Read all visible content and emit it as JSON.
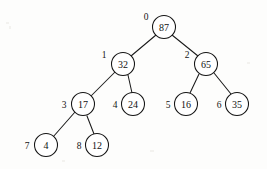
{
  "figure": {
    "kind": "binary-tree-diagram",
    "background_color": "#fdfdfc",
    "stroke_color": "#141414",
    "node_fill_color": "#ffffff",
    "node_radius": 11.5,
    "width": 267,
    "height": 169
  },
  "nodes": [
    {
      "index": "0",
      "value": "87",
      "cx": 164,
      "cy": 27,
      "index_x": 146,
      "index_y": 17
    },
    {
      "index": "1",
      "value": "32",
      "cx": 123,
      "cy": 64,
      "index_x": 104,
      "index_y": 55
    },
    {
      "index": "2",
      "value": "65",
      "cx": 206,
      "cy": 64,
      "index_x": 187,
      "index_y": 55
    },
    {
      "index": "3",
      "value": "17",
      "cx": 83,
      "cy": 104,
      "index_x": 64,
      "index_y": 105
    },
    {
      "index": "4",
      "value": "24",
      "cx": 133,
      "cy": 104,
      "index_x": 115,
      "index_y": 105
    },
    {
      "index": "5",
      "value": "16",
      "cx": 186,
      "cy": 104,
      "index_x": 168,
      "index_y": 105
    },
    {
      "index": "6",
      "value": "35",
      "cx": 237,
      "cy": 104,
      "index_x": 219,
      "index_y": 105
    },
    {
      "index": "7",
      "value": "4",
      "cx": 46,
      "cy": 145,
      "index_x": 27,
      "index_y": 146
    },
    {
      "index": "8",
      "value": "12",
      "cx": 97,
      "cy": 145,
      "index_x": 79,
      "index_y": 146
    }
  ],
  "edges": [
    {
      "name": "edge-87-32",
      "from": "0",
      "to": "1",
      "x1": 156,
      "y1": 35,
      "x2": 131,
      "y2": 56
    },
    {
      "name": "edge-87-65",
      "from": "0",
      "to": "2",
      "x1": 172,
      "y1": 35,
      "x2": 198,
      "y2": 56
    },
    {
      "name": "edge-32-17",
      "from": "1",
      "to": "3",
      "x1": 115,
      "y1": 72,
      "x2": 91,
      "y2": 96
    },
    {
      "name": "edge-32-24",
      "from": "1",
      "to": "4",
      "x1": 128,
      "y1": 75,
      "x2": 132,
      "y2": 93
    },
    {
      "name": "edge-65-16",
      "from": "2",
      "to": "5",
      "x1": 199,
      "y1": 74,
      "x2": 190,
      "y2": 93
    },
    {
      "name": "edge-65-35",
      "from": "2",
      "to": "6",
      "x1": 214,
      "y1": 73,
      "x2": 231,
      "y2": 94
    },
    {
      "name": "edge-17-4",
      "from": "3",
      "to": "7",
      "x1": 75,
      "y1": 112,
      "x2": 53,
      "y2": 137
    },
    {
      "name": "edge-17-12",
      "from": "3",
      "to": "8",
      "x1": 87,
      "y1": 116,
      "x2": 94,
      "y2": 134
    }
  ],
  "tree_data": {
    "type": "binary-tree",
    "array_representation": [
      "87",
      "32",
      "65",
      "17",
      "24",
      "16",
      "35",
      "4",
      "12"
    ],
    "root_index": "0",
    "levels": [
      {
        "depth": 0,
        "indices": [
          "0"
        ],
        "values": [
          "87"
        ]
      },
      {
        "depth": 1,
        "indices": [
          "1",
          "2"
        ],
        "values": [
          "32",
          "65"
        ]
      },
      {
        "depth": 2,
        "indices": [
          "3",
          "4",
          "5",
          "6"
        ],
        "values": [
          "17",
          "24",
          "16",
          "35"
        ]
      },
      {
        "depth": 3,
        "indices": [
          "7",
          "8"
        ],
        "values": [
          "4",
          "12"
        ]
      }
    ],
    "relations": [
      {
        "parent_index": "0",
        "parent_value": "87",
        "child_index": "1",
        "child_value": "32",
        "side": "left"
      },
      {
        "parent_index": "0",
        "parent_value": "87",
        "child_index": "2",
        "child_value": "65",
        "side": "right"
      },
      {
        "parent_index": "1",
        "parent_value": "32",
        "child_index": "3",
        "child_value": "17",
        "side": "left"
      },
      {
        "parent_index": "1",
        "parent_value": "32",
        "child_index": "4",
        "child_value": "24",
        "side": "right"
      },
      {
        "parent_index": "2",
        "parent_value": "65",
        "child_index": "5",
        "child_value": "16",
        "side": "left"
      },
      {
        "parent_index": "2",
        "parent_value": "65",
        "child_index": "6",
        "child_value": "35",
        "side": "right"
      },
      {
        "parent_index": "3",
        "parent_value": "17",
        "child_index": "7",
        "child_value": "4",
        "side": "left"
      },
      {
        "parent_index": "3",
        "parent_value": "17",
        "child_index": "8",
        "child_value": "12",
        "side": "right"
      }
    ]
  }
}
